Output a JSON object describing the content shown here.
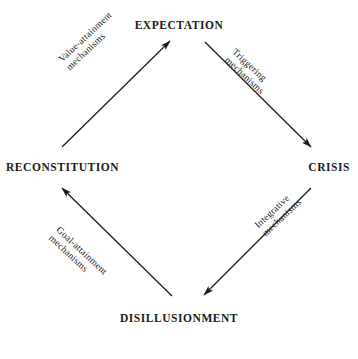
{
  "diagram": {
    "type": "cycle-diagram",
    "shape": "diamond",
    "top_caption": "",
    "line_color": "#1b1b1b",
    "text_color": "#1b1b1b",
    "background_color": "#ffffff",
    "nodes": [
      {
        "id": "expectation",
        "label": "EXPECTATION",
        "position": "top"
      },
      {
        "id": "crisis",
        "label": "CRISIS",
        "position": "right"
      },
      {
        "id": "disillusionment",
        "label": "DISILLUSIONMENT",
        "position": "bottom"
      },
      {
        "id": "reconstitution",
        "label": "RECONSTITUTION",
        "position": "left"
      }
    ],
    "edges": [
      {
        "id": "expectation-to-crisis",
        "from": "EXPECTATION",
        "to": "CRISIS",
        "label_line1": "Triggering",
        "label_line2": "mechanisms",
        "direction": "down-right"
      },
      {
        "id": "crisis-to-disillusionment",
        "from": "CRISIS",
        "to": "DISILLUSIONMENT",
        "label_line1": "Integrative",
        "label_line2": "mechanisms",
        "direction": "down-left"
      },
      {
        "id": "disillusionment-to-reconstitution",
        "from": "DISILLUSIONMENT",
        "to": "RECONSTITUTION",
        "label_line1": "Goal-attainment",
        "label_line2": "mechanisms",
        "direction": "up-left"
      },
      {
        "id": "reconstitution-to-expectation",
        "from": "RECONSTITUTION",
        "to": "EXPECTATION",
        "label_line1": "Value-attainment",
        "label_line2": "mechanisms",
        "direction": "up-right"
      }
    ]
  }
}
